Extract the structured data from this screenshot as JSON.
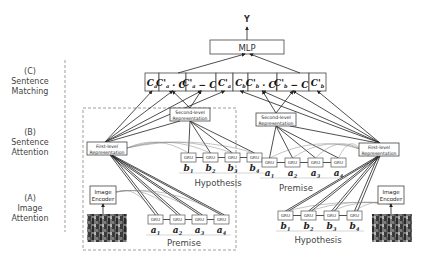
{
  "output": {
    "label": "Y"
  },
  "mlp": {
    "label": "MLP"
  },
  "sections": [
    {
      "letter": "(C)",
      "line1": "Sentence",
      "line2": "Matching"
    },
    {
      "letter": "(B)",
      "line1": "Sentence",
      "line2": "Attention"
    },
    {
      "letter": "(A)",
      "line1": "Image",
      "line2": "Attention"
    }
  ],
  "features": [
    "C_a",
    "C'_a · C_a",
    "C'_a − C_a",
    "C'_a",
    "C_b",
    "C'_b · C_b",
    "C'_b − C_b",
    "C'_b"
  ],
  "representations": {
    "first_level": {
      "line1": "First-level",
      "line2": "Representation"
    },
    "second_level": {
      "line1": "Second-level",
      "line2": "Representation"
    }
  },
  "image_encoder": {
    "line1": "Image",
    "line2": "Encoder"
  },
  "gru": {
    "label": "GRU"
  },
  "left_panel": {
    "hypothesis": {
      "tokens": [
        "b1",
        "b2",
        "b3",
        "b4"
      ],
      "caption": "Hypothesis"
    },
    "premise": {
      "tokens": [
        "a1",
        "a2",
        "a3",
        "a4"
      ],
      "caption": "Premise"
    }
  },
  "right_panel": {
    "premise": {
      "tokens": [
        "a1",
        "a2",
        "a3",
        "a4"
      ],
      "caption": "Premise"
    },
    "hypothesis": {
      "tokens": [
        "b1",
        "b2",
        "b3",
        "b4"
      ],
      "caption": "Hypothesis"
    }
  }
}
